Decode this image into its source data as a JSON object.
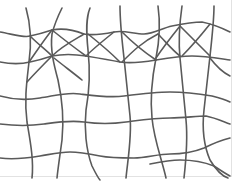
{
  "drawing": {
    "description": "Hand-drawn warped grid with web-like diagonal crossings in the upper band",
    "stroke_color": "#5a5a5a",
    "stroke_width": 1.6,
    "background": "#ffffff",
    "border_color": "#e2e2e2"
  }
}
